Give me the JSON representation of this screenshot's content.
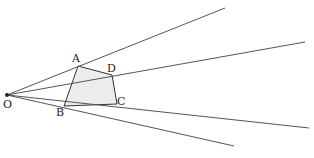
{
  "diagram": {
    "title": "",
    "origin": {
      "label": "O",
      "x": 7,
      "y": 95,
      "label_x": 3,
      "label_y": 99
    },
    "points": [
      {
        "id": "A",
        "label": "A",
        "x": 78,
        "y": 66,
        "label_x": 72,
        "label_y": 53
      },
      {
        "id": "D",
        "label": "D",
        "x": 112,
        "y": 75,
        "label_x": 107,
        "label_y": 63
      },
      {
        "id": "C",
        "label": "C",
        "x": 117,
        "y": 104,
        "label_x": 117,
        "label_y": 96
      },
      {
        "id": "B",
        "label": "B",
        "x": 64,
        "y": 106,
        "label_x": 56,
        "label_y": 107
      }
    ],
    "rays": [
      {
        "id": "ray-OA",
        "through": "A",
        "end_x": 225,
        "end_y": 8
      },
      {
        "id": "ray-OD",
        "through": "D",
        "end_x": 305,
        "end_y": 42
      },
      {
        "id": "ray-OC",
        "through": "C",
        "end_x": 309,
        "end_y": 128
      },
      {
        "id": "ray-OB",
        "through": "B",
        "end_x": 234,
        "end_y": 146
      }
    ],
    "quadrilateral": {
      "vertices": [
        "A",
        "D",
        "C",
        "B"
      ],
      "fill": "#ececec",
      "stroke": "#333333"
    },
    "line_color": "#555555"
  }
}
